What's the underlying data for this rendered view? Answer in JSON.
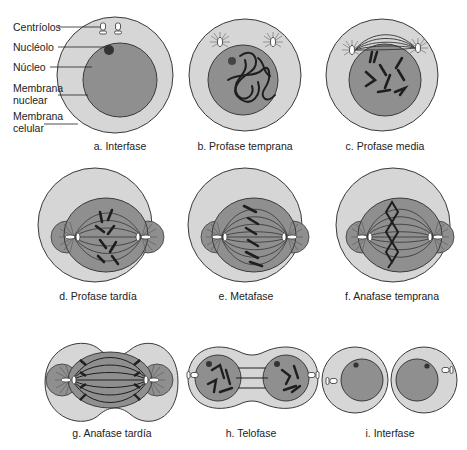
{
  "colors": {
    "cytoplasm": "#d6d6d6",
    "nucleus": "#8f8f8f",
    "outline": "#3a3a3a",
    "chromosome": "#1e1e1e",
    "background": "#ffffff"
  },
  "parts": {
    "centriolos": "Centríolos",
    "nucleolo": "Nucléolo",
    "nucleo": "Núcleo",
    "membrana_nuclear_1": "Membrana",
    "membrana_nuclear_2": "nuclear",
    "membrana_celular_1": "Membrana",
    "membrana_celular_2": "celular"
  },
  "stages": [
    {
      "id": "a",
      "label": "a. Interfase"
    },
    {
      "id": "b",
      "label": "b. Profase temprana"
    },
    {
      "id": "c",
      "label": "c. Profase media"
    },
    {
      "id": "d",
      "label": "d. Profase tardía"
    },
    {
      "id": "e",
      "label": "e. Metafase"
    },
    {
      "id": "f",
      "label": "f. Anafase temprana"
    },
    {
      "id": "g",
      "label": "g. Anafase tardía"
    },
    {
      "id": "h",
      "label": "h. Telofase"
    },
    {
      "id": "i",
      "label": "i. Interfase"
    }
  ]
}
